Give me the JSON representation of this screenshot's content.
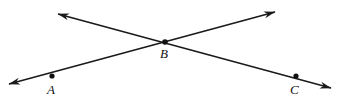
{
  "figure": {
    "name": "intersecting-lines-figure",
    "background_color": "#ffffff",
    "stroke_color": "#1a1a1a",
    "stroke_width": 1.6,
    "width": 343,
    "height": 104
  },
  "points": [
    {
      "id": "A",
      "label": "A",
      "x": 52,
      "y": 76,
      "label_x": 47,
      "label_y": 83,
      "dot_radius": 2.6
    },
    {
      "id": "B",
      "label": "B",
      "x": 165,
      "y": 42,
      "label_x": 160,
      "label_y": 47,
      "dot_radius": 2.8
    },
    {
      "id": "C",
      "label": "C",
      "x": 296,
      "y": 76,
      "label_x": 290,
      "label_y": 83,
      "dot_radius": 2.6
    }
  ],
  "lines": [
    {
      "id": "line-A-B",
      "name": "line-through-a-and-b",
      "from": {
        "x": 9,
        "y": 84
      },
      "to": {
        "x": 275,
        "y": 12
      },
      "arrow_start": true,
      "arrow_end": true,
      "passes_through": [
        "A",
        "B"
      ]
    },
    {
      "id": "line-B-C",
      "name": "line-through-b-and-c",
      "from": {
        "x": 58,
        "y": 14
      },
      "to": {
        "x": 331,
        "y": 88
      },
      "arrow_start": true,
      "arrow_end": true,
      "passes_through": [
        "B",
        "C"
      ]
    }
  ],
  "arrowhead": {
    "length": 11,
    "width": 5
  }
}
